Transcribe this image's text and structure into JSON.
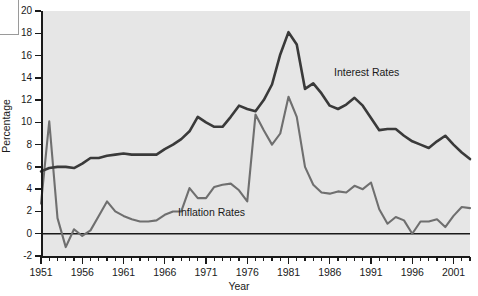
{
  "chart_data": {
    "type": "line",
    "title": "",
    "xlabel": "Year",
    "ylabel": "Percentage",
    "xlim": [
      1951,
      2003
    ],
    "ylim": [
      -2,
      20
    ],
    "ytick_step": 2,
    "xtick_major_step": 5,
    "xtick_minor_step": 1,
    "grid": false,
    "legend_position": "inline-annotations",
    "x": [
      1951,
      1952,
      1953,
      1954,
      1955,
      1956,
      1957,
      1958,
      1959,
      1960,
      1961,
      1962,
      1963,
      1964,
      1965,
      1966,
      1967,
      1968,
      1969,
      1970,
      1971,
      1972,
      1973,
      1974,
      1975,
      1976,
      1977,
      1978,
      1979,
      1980,
      1981,
      1982,
      1983,
      1984,
      1985,
      1986,
      1987,
      1988,
      1989,
      1990,
      1991,
      1992,
      1993,
      1994,
      1995,
      1996,
      1997,
      1998,
      1999,
      2000,
      2001,
      2002,
      2003
    ],
    "series": [
      {
        "name": "Interest Rates",
        "color": "#3a3a3a",
        "values": [
          5.6,
          5.9,
          6.0,
          6.0,
          5.9,
          6.3,
          6.8,
          6.8,
          7.0,
          7.1,
          7.2,
          7.1,
          7.1,
          7.1,
          7.1,
          7.6,
          8.0,
          8.5,
          9.2,
          10.5,
          10.0,
          9.6,
          9.6,
          10.5,
          11.5,
          11.2,
          11.0,
          12.0,
          13.4,
          16.1,
          18.1,
          17.0,
          13.0,
          13.5,
          12.6,
          11.5,
          11.2,
          11.6,
          12.2,
          11.5,
          10.4,
          9.3,
          9.4,
          9.4,
          8.8,
          8.3,
          8.0,
          7.7,
          8.3,
          8.8,
          8.0,
          7.3,
          6.7
        ]
      },
      {
        "name": "Inflation Rates",
        "color": "#6f6f6f",
        "values": [
          2.7,
          10.1,
          1.4,
          -1.2,
          0.4,
          -0.2,
          0.3,
          1.6,
          2.9,
          2.0,
          1.6,
          1.3,
          1.1,
          1.1,
          1.2,
          1.7,
          2.0,
          2.0,
          4.1,
          3.2,
          3.2,
          4.2,
          4.4,
          4.5,
          3.9,
          2.9,
          10.7,
          9.3,
          8.0,
          9.0,
          12.3,
          10.5,
          6.0,
          4.4,
          3.7,
          3.6,
          3.8,
          3.7,
          4.3,
          4.0,
          4.6,
          2.2,
          0.9,
          1.5,
          1.2,
          0.0,
          1.1,
          1.1,
          1.3,
          0.6,
          1.6,
          2.4,
          2.3
        ]
      }
    ],
    "annotations": [
      {
        "text": "Interest Rates",
        "series": "Interest Rates"
      },
      {
        "text": "Inflation Rates",
        "series": "Inflation Rates"
      }
    ]
  },
  "axes": {
    "y_ticks": [
      20,
      18,
      16,
      14,
      12,
      10,
      8,
      6,
      4,
      2,
      0,
      -2
    ],
    "x_ticks_major": [
      1951,
      1956,
      1961,
      1966,
      1971,
      1976,
      1981,
      1986,
      1991,
      1996,
      2001
    ],
    "y_title": "Percentage",
    "x_title": "Year"
  },
  "colors": {
    "plot_background": "#e6e6e6",
    "page_background": "#ffffff",
    "axis": "#1a1a1a",
    "interest_line": "#3a3a3a",
    "inflation_line": "#6f6f6f"
  }
}
